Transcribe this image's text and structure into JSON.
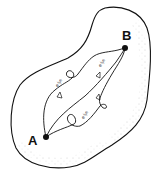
{
  "diagram": {
    "points": [
      {
        "id": "A",
        "label": "A",
        "x": 46,
        "y": 137
      },
      {
        "id": "B",
        "label": "B",
        "x": 125,
        "y": 48
      }
    ],
    "path_labels": [
      {
        "text": "e^{iS/ħ}",
        "display": "eⁱˢ/ʰ",
        "path": "upper-left"
      },
      {
        "text": "e^{iS/ħ}",
        "display": "eⁱˢ/ʰ",
        "path": "middle"
      },
      {
        "text": "e^{iS/ħ}",
        "display": "eⁱˢ/ʰ",
        "path": "lower"
      }
    ],
    "colors": {
      "stroke": "#111111",
      "stipple": "#9a9a9a",
      "background": "#ffffff"
    }
  }
}
